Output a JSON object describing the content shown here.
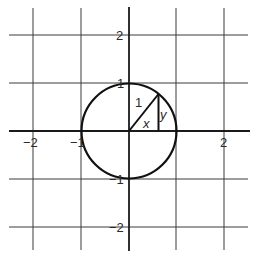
{
  "figure": {
    "grid": {
      "x_lines": [
        -2,
        -1,
        1,
        2
      ],
      "y_lines": [
        -2,
        -1,
        1,
        2
      ],
      "color": "#3a3a3a"
    },
    "axes": {
      "color": "#1a1a1a",
      "x_range": [
        -2.5,
        2.5
      ],
      "y_range": [
        -2.5,
        2.5
      ]
    },
    "x_tick_labels": [
      {
        "value": -2,
        "label": "−2"
      },
      {
        "value": -1,
        "label": "−1"
      },
      {
        "value": 2,
        "label": "2"
      }
    ],
    "y_tick_labels": [
      {
        "value": 2,
        "label": "2"
      },
      {
        "value": 1,
        "label": "1"
      },
      {
        "value": -1,
        "label": "−1"
      },
      {
        "value": -2,
        "label": "−2"
      }
    ],
    "circle": {
      "center": [
        0,
        0
      ],
      "radius": 1,
      "color": "#111111"
    },
    "triangle": {
      "point_on_circle": [
        0.62,
        0.78
      ],
      "hypotenuse_label": "1",
      "base_label": "x",
      "height_label": "y"
    }
  }
}
